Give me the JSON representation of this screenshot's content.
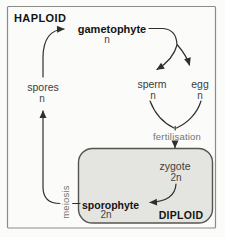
{
  "diagram": {
    "haploid_label": "HAPLOID",
    "diploid_label": "DIPLOID",
    "nodes": {
      "gametophyte": {
        "name": "gametophyte",
        "ploidy": "n"
      },
      "spores": {
        "name": "spores",
        "ploidy": "n"
      },
      "sperm": {
        "name": "sperm",
        "ploidy": "n"
      },
      "egg": {
        "name": "egg",
        "ploidy": "n"
      },
      "zygote": {
        "name": "zygote",
        "ploidy": "2n"
      },
      "sporophyte": {
        "name": "sporophyte",
        "ploidy": "2n"
      }
    },
    "processes": {
      "fertilisation": "fertilisation",
      "meiosis": "meiosis"
    }
  },
  "colors": {
    "background": "#fbfbf9",
    "frame_border": "#8b8b87",
    "diploid_box_fill": "#e4e4e1",
    "diploid_box_border": "#56544e",
    "arrow": "#2f2f2c",
    "text_bold": "#141414",
    "text_node": "#3d3d3a",
    "text_process": "#75746d"
  }
}
